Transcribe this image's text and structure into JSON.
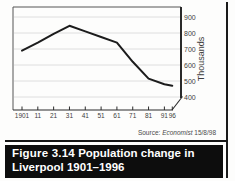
{
  "figure": {
    "source_prefix": "Source:",
    "source_name": "Economist",
    "source_date": "15/8/98",
    "caption_label": "Figure 3.14",
    "caption_line1_text": "Population change in",
    "caption_line2_text": "Liverpool 1901–1996"
  },
  "chart_data": {
    "type": "line",
    "x": [
      1901,
      1911,
      1921,
      1931,
      1941,
      1951,
      1961,
      1971,
      1981,
      1991,
      1996
    ],
    "x_tick_labels": [
      "1901",
      "11",
      "21",
      "31",
      "41",
      "51",
      "61",
      "71",
      "81",
      "91",
      "96"
    ],
    "values": [
      690,
      740,
      795,
      845,
      810,
      775,
      740,
      620,
      515,
      480,
      470
    ],
    "series_name": "Liverpool population",
    "ylabel": "Thousands",
    "y_ticks": [
      400,
      500,
      600,
      700,
      800,
      900
    ],
    "ylim": [
      400,
      900
    ],
    "grid": true,
    "axis_break": true,
    "legend": "none",
    "y_axis_side": "right",
    "line_color": "#1c1c1c",
    "grid_color": "#dedede",
    "axis_color": "#2a2a2a"
  }
}
